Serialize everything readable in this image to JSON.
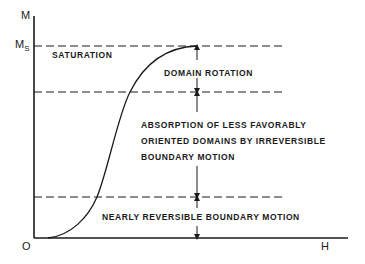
{
  "axes": {
    "y_label": "M",
    "ms_label_main": "M",
    "ms_label_sub": "S",
    "origin_label": "O",
    "x_label": "H"
  },
  "regions": {
    "saturation": "SATURATION",
    "domain_rotation": "DOMAIN ROTATION",
    "irreversible_line1": "ABSORPTION OF LESS FAVORABLY",
    "irreversible_line2": "ORIENTED DOMAINS BY IRREVERSIBLE",
    "irreversible_line3": "BOUNDARY MOTION",
    "reversible": "NEARLY REVERSIBLE BOUNDARY MOTION"
  },
  "colors": {
    "ink": "#1a1a1a",
    "background": "#ffffff"
  }
}
